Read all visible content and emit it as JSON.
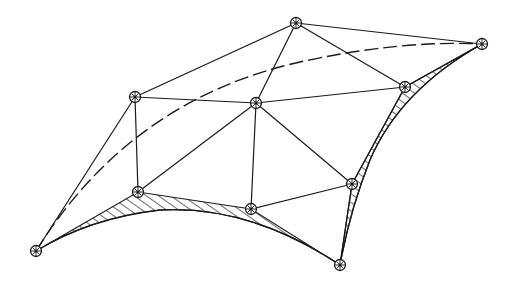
{
  "diagram": {
    "title": "",
    "colors": {
      "line": "#1a1a1a",
      "background": "#ffffff"
    },
    "nodes": [
      {
        "id": "A",
        "x": 296,
        "y": 23
      },
      {
        "id": "B",
        "x": 482,
        "y": 44
      },
      {
        "id": "C",
        "x": 135,
        "y": 97
      },
      {
        "id": "D",
        "x": 256,
        "y": 103
      },
      {
        "id": "E",
        "x": 405,
        "y": 87
      },
      {
        "id": "F",
        "x": 352,
        "y": 184
      },
      {
        "id": "G",
        "x": 138,
        "y": 192
      },
      {
        "id": "H",
        "x": 251,
        "y": 209
      },
      {
        "id": "I",
        "x": 36,
        "y": 251
      },
      {
        "id": "J",
        "x": 340,
        "y": 265
      }
    ],
    "edges": [
      [
        "C",
        "A"
      ],
      [
        "A",
        "B"
      ],
      [
        "A",
        "D"
      ],
      [
        "A",
        "E"
      ],
      [
        "C",
        "D"
      ],
      [
        "D",
        "E"
      ],
      [
        "E",
        "B"
      ],
      [
        "C",
        "G"
      ],
      [
        "C",
        "I"
      ],
      [
        "D",
        "G"
      ],
      [
        "D",
        "H"
      ],
      [
        "D",
        "F"
      ],
      [
        "E",
        "F"
      ],
      [
        "H",
        "F"
      ],
      [
        "F",
        "J"
      ],
      [
        "G",
        "I"
      ],
      [
        "G",
        "H"
      ],
      [
        "H",
        "J"
      ]
    ],
    "curved_edges": [
      {
        "from": "I",
        "to": "J",
        "style": "solid",
        "label": "lower boundary cable"
      },
      {
        "from": "J",
        "to": "B",
        "style": "solid",
        "label": "right boundary cable"
      },
      {
        "from": "I",
        "to": "B",
        "style": "dashed",
        "label": "ridge line"
      }
    ],
    "hatched_regions": [
      {
        "bounded_by": [
          "I",
          "G",
          "H",
          "J"
        ],
        "label": "lower membrane edge"
      },
      {
        "bounded_by": [
          "F",
          "E",
          "B",
          "J"
        ],
        "label": "right membrane edge"
      }
    ]
  }
}
